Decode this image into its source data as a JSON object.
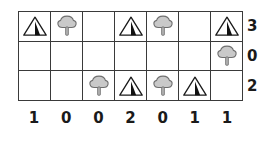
{
  "puzzle": {
    "type": "tents-and-trees",
    "columns": 7,
    "rows": 3,
    "row_clues": [
      "3",
      "0",
      "2"
    ],
    "column_clues": [
      "1",
      "0",
      "0",
      "2",
      "0",
      "1",
      "1"
    ],
    "icon_names": {
      "tent": "tent-icon",
      "tree": "tree-icon",
      "empty": "empty-cell"
    },
    "colors": {
      "grid_line": "#3a3a3a",
      "clue_text": "#1a1a1a",
      "tent_outline": "#1a1a1a",
      "tent_flap": "#111111",
      "tree_canopy_fill": "#c9c9c9",
      "tree_canopy_stroke": "#6e6e6e",
      "tree_trunk_fill": "#b8b8b8",
      "background": "#ffffff"
    },
    "grid": [
      [
        "tent",
        "tree",
        "empty",
        "tent",
        "tree",
        "empty",
        "tent"
      ],
      [
        "empty",
        "empty",
        "empty",
        "empty",
        "empty",
        "empty",
        "tree"
      ],
      [
        "empty",
        "empty",
        "tree",
        "tent",
        "tree",
        "tent",
        "empty"
      ]
    ]
  }
}
